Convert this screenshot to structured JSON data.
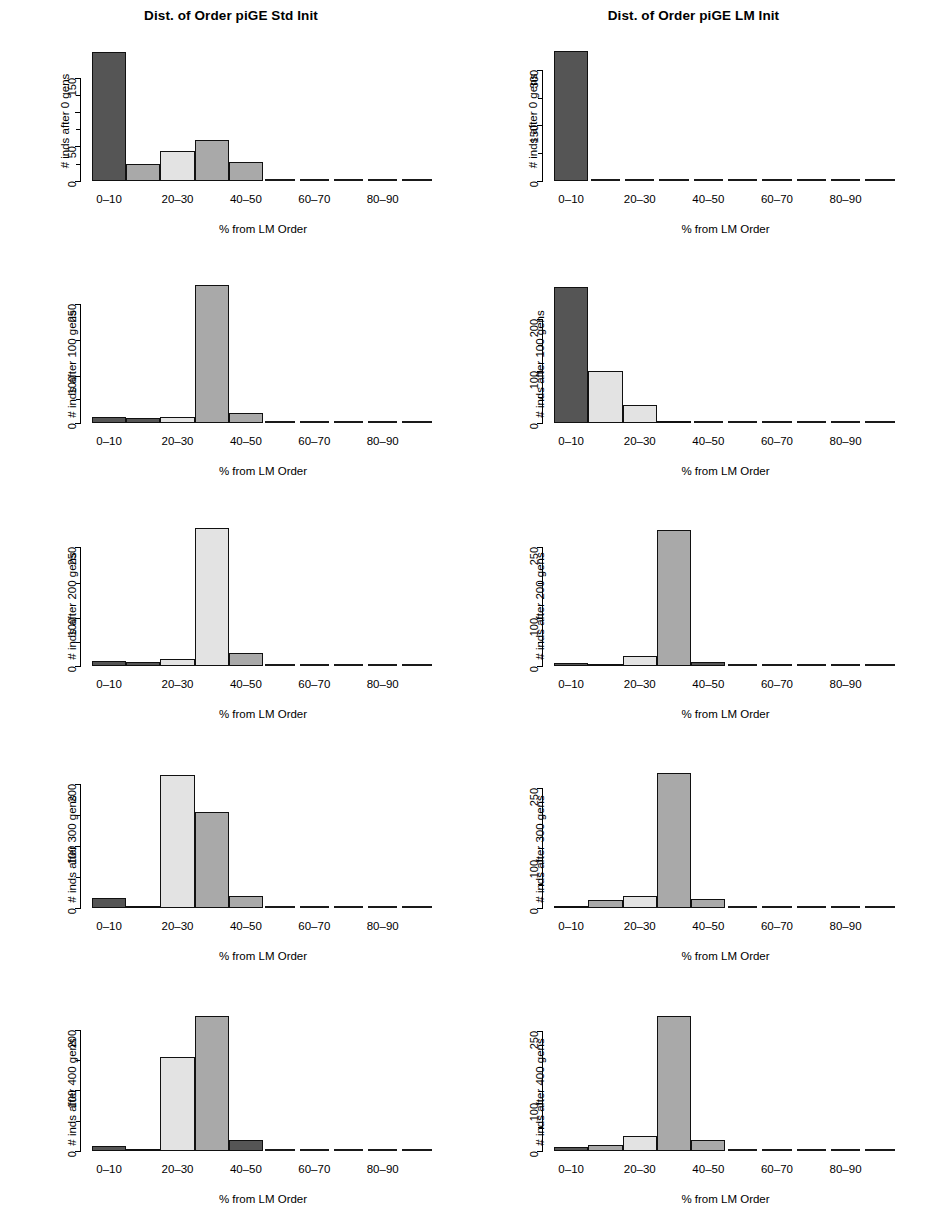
{
  "figure": {
    "columns": [
      "Dist. of Order piGE Std Init",
      "Dist. of Order piGE LM Init"
    ],
    "xlabel": "% from LM Order",
    "bin_labels": [
      "0-10",
      "10-20",
      "20-30",
      "30-40",
      "40-50",
      "50-60",
      "60-70",
      "70-80",
      "80-90",
      "90-100"
    ],
    "shown_xticks": [
      "0–10",
      "20–30",
      "40–50",
      "60–70",
      "80–90"
    ],
    "shown_xtick_bins": [
      0,
      2,
      4,
      6,
      8
    ],
    "bar_colors": {
      "dark": "#555555",
      "medium": "#a9a9a9",
      "light": "#e3e3e3",
      "border": "#111111"
    }
  },
  "chart_data": [
    {
      "type": "bar",
      "title": "Dist. of Order piGE Std Init",
      "ylabel": "# inds after 0 gens",
      "xlabel": "% from LM Order",
      "categories": [
        "0-10",
        "10-20",
        "20-30",
        "30-40",
        "40-50",
        "50-60",
        "60-70",
        "70-80",
        "80-90",
        "90-100"
      ],
      "values": [
        188,
        24,
        44,
        60,
        27,
        0,
        0,
        0,
        0,
        0
      ],
      "shades": [
        "dark",
        "medium",
        "light",
        "medium",
        "medium",
        "none",
        "none",
        "none",
        "none",
        "none"
      ],
      "ylim": [
        0,
        200
      ],
      "yticks": [
        0,
        50,
        100,
        150
      ],
      "ytick_labels": [
        "0",
        "50",
        "",
        "150"
      ],
      "grid": false
    },
    {
      "type": "bar",
      "title": "Dist. of Order piGE LM Init",
      "ylabel": "# inds after 0 gens",
      "xlabel": "% from LM Order",
      "categories": [
        "0-10",
        "10-20",
        "20-30",
        "30-40",
        "40-50",
        "50-60",
        "60-70",
        "70-80",
        "80-90",
        "90-100"
      ],
      "values": [
        350,
        0,
        0,
        0,
        0,
        0,
        0,
        0,
        0,
        0
      ],
      "shades": [
        "dark",
        "none",
        "none",
        "none",
        "none",
        "none",
        "none",
        "none",
        "none",
        "none"
      ],
      "ylim": [
        0,
        370
      ],
      "yticks": [
        0,
        150,
        300
      ],
      "ytick_labels": [
        "0",
        "150",
        "300"
      ],
      "grid": false
    },
    {
      "type": "bar",
      "title": "",
      "ylabel": "# inds after 100 gens",
      "xlabel": "% from LM Order",
      "categories": [
        "0-10",
        "10-20",
        "20-30",
        "30-40",
        "40-50",
        "50-60",
        "60-70",
        "70-80",
        "80-90",
        "90-100"
      ],
      "values": [
        14,
        10,
        12,
        290,
        22,
        0,
        0,
        0,
        0,
        0
      ],
      "shades": [
        "dark",
        "dark",
        "light",
        "medium",
        "medium",
        "none",
        "none",
        "none",
        "none",
        "none"
      ],
      "ylim": [
        0,
        300
      ],
      "yticks": [
        0,
        100,
        250
      ],
      "ytick_labels": [
        "0",
        "100",
        "250"
      ],
      "grid": false
    },
    {
      "type": "bar",
      "title": "",
      "ylabel": "# inds after 100 gens",
      "xlabel": "% from LM Order",
      "categories": [
        "0-10",
        "10-20",
        "20-30",
        "30-40",
        "40-50",
        "50-60",
        "60-70",
        "70-80",
        "80-90",
        "90-100"
      ],
      "values": [
        262,
        100,
        35,
        3,
        0,
        0,
        0,
        0,
        0,
        0
      ],
      "shades": [
        "dark",
        "light",
        "light",
        "medium",
        "none",
        "none",
        "none",
        "none",
        "none",
        "none"
      ],
      "ylim": [
        0,
        275
      ],
      "yticks": [
        0,
        100,
        200
      ],
      "ytick_labels": [
        "0",
        "100",
        "200"
      ],
      "grid": false
    },
    {
      "type": "bar",
      "title": "",
      "ylabel": "# inds after 200 gens",
      "xlabel": "% from LM Order",
      "categories": [
        "0-10",
        "10-20",
        "20-30",
        "30-40",
        "40-50",
        "50-60",
        "60-70",
        "70-80",
        "80-90",
        "90-100"
      ],
      "values": [
        10,
        9,
        14,
        290,
        28,
        0,
        0,
        0,
        0,
        0
      ],
      "shades": [
        "dark",
        "dark",
        "light",
        "light",
        "medium",
        "none",
        "none",
        "none",
        "none",
        "none"
      ],
      "ylim": [
        0,
        300
      ],
      "yticks": [
        0,
        100,
        250
      ],
      "ytick_labels": [
        "0",
        "100",
        "250"
      ],
      "grid": false
    },
    {
      "type": "bar",
      "title": "",
      "ylabel": "# inds after 200 gens",
      "xlabel": "% from LM Order",
      "categories": [
        "0-10",
        "10-20",
        "20-30",
        "30-40",
        "40-50",
        "50-60",
        "60-70",
        "70-80",
        "80-90",
        "90-100"
      ],
      "values": [
        5,
        4,
        20,
        285,
        9,
        0,
        0,
        0,
        0,
        0
      ],
      "shades": [
        "dark",
        "dark",
        "light",
        "medium",
        "dark",
        "none",
        "none",
        "none",
        "none",
        "none"
      ],
      "ylim": [
        0,
        300
      ],
      "yticks": [
        0,
        100,
        250
      ],
      "ytick_labels": [
        "0",
        "100",
        "250"
      ],
      "grid": false
    },
    {
      "type": "bar",
      "title": "",
      "ylabel": "# inds after 300 gens",
      "xlabel": "% from LM Order",
      "categories": [
        "0-10",
        "10-20",
        "20-30",
        "30-40",
        "40-50",
        "50-60",
        "60-70",
        "70-80",
        "80-90",
        "90-100"
      ],
      "values": [
        16,
        3,
        215,
        155,
        20,
        0,
        0,
        0,
        0,
        0
      ],
      "shades": [
        "dark",
        "dark",
        "light",
        "medium",
        "medium",
        "none",
        "none",
        "none",
        "none",
        "none"
      ],
      "ylim": [
        0,
        230
      ],
      "yticks": [
        0,
        100,
        200
      ],
      "ytick_labels": [
        "0",
        "100",
        "200"
      ],
      "grid": false
    },
    {
      "type": "bar",
      "title": "",
      "ylabel": "# inds after 300 gens",
      "xlabel": "% from LM Order",
      "categories": [
        "0-10",
        "10-20",
        "20-30",
        "30-40",
        "40-50",
        "50-60",
        "60-70",
        "70-80",
        "80-90",
        "90-100"
      ],
      "values": [
        6,
        18,
        25,
        280,
        20,
        0,
        0,
        0,
        0,
        0
      ],
      "shades": [
        "dark",
        "medium",
        "light",
        "medium",
        "medium",
        "none",
        "none",
        "none",
        "none",
        "none"
      ],
      "ylim": [
        0,
        295
      ],
      "yticks": [
        0,
        100,
        250
      ],
      "ytick_labels": [
        "0",
        "100",
        "250"
      ],
      "grid": false
    },
    {
      "type": "bar",
      "title": "",
      "ylabel": "# inds after 400 gens",
      "xlabel": "% from LM Order",
      "categories": [
        "0-10",
        "10-20",
        "20-30",
        "30-40",
        "40-50",
        "50-60",
        "60-70",
        "70-80",
        "80-90",
        "90-100"
      ],
      "values": [
        9,
        3,
        155,
        222,
        18,
        0,
        0,
        0,
        0,
        0
      ],
      "shades": [
        "dark",
        "dark",
        "light",
        "medium",
        "dark",
        "none",
        "none",
        "none",
        "none",
        "none"
      ],
      "ylim": [
        0,
        235
      ],
      "yticks": [
        0,
        100,
        200
      ],
      "ytick_labels": [
        "0",
        "100",
        "200"
      ],
      "grid": false
    },
    {
      "type": "bar",
      "title": "",
      "ylabel": "# inds after 400 gens",
      "xlabel": "% from LM Order",
      "categories": [
        "0-10",
        "10-20",
        "20-30",
        "30-40",
        "40-50",
        "50-60",
        "60-70",
        "70-80",
        "80-90",
        "90-100"
      ],
      "values": [
        8,
        12,
        32,
        282,
        22,
        0,
        0,
        0,
        0,
        0
      ],
      "shades": [
        "dark",
        "medium",
        "light",
        "medium",
        "medium",
        "none",
        "none",
        "none",
        "none",
        "none"
      ],
      "ylim": [
        0,
        297
      ],
      "yticks": [
        0,
        100,
        250
      ],
      "ytick_labels": [
        "0",
        "100",
        "250"
      ],
      "grid": false
    }
  ]
}
